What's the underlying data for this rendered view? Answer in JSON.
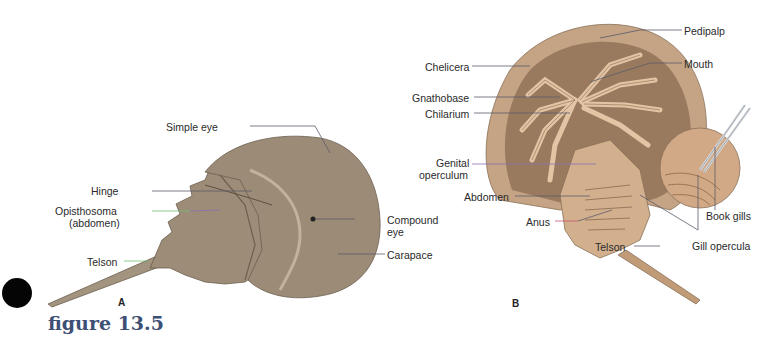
{
  "figure": {
    "caption": "figure 13.5",
    "panels": [
      {
        "id": "A",
        "label": "A",
        "view": "dorsal",
        "annotations": [
          {
            "text": "Simple eye"
          },
          {
            "text": "Hinge"
          },
          {
            "text": "Opisthosoma"
          },
          {
            "text": "(abdomen)"
          },
          {
            "text": "Telson"
          },
          {
            "text": "Compound"
          },
          {
            "text": "eye"
          },
          {
            "text": "Carapace"
          }
        ]
      },
      {
        "id": "B",
        "label": "B",
        "view": "ventral",
        "annotations": [
          {
            "text": "Pedipalp"
          },
          {
            "text": "Chelicera"
          },
          {
            "text": "Mouth"
          },
          {
            "text": "Gnathobase"
          },
          {
            "text": "Chilarium"
          },
          {
            "text": "Genital"
          },
          {
            "text": "operculum"
          },
          {
            "text": "Abdomen"
          },
          {
            "text": "Anus"
          },
          {
            "text": "Book gills"
          },
          {
            "text": "Telson"
          },
          {
            "text": "Gill opercula"
          }
        ]
      }
    ]
  },
  "colors": {
    "shell": "#9c8b76",
    "shell_dark": "#7a6b59",
    "shell_light": "#b5a58f",
    "ventral": "#c9a27f",
    "ventral_light": "#dcbb98",
    "leader_gray": "#5b5b6b",
    "leader_green": "#6fbf73",
    "leader_purple": "#8a6fb5",
    "leader_red": "#c8536b",
    "caption": "#3d4f74"
  }
}
